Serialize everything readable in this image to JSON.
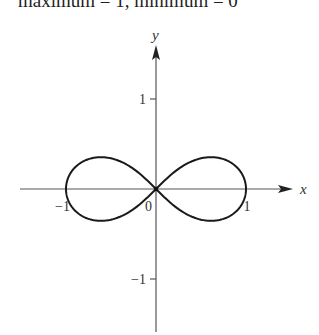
{
  "caption": "maximum = 1, minimum = 0",
  "chart_data": {
    "type": "line",
    "title": "",
    "curve": "lemniscate r^2 = cos(2θ)",
    "xlabel": "x",
    "ylabel": "y",
    "xlim": [
      -1.5,
      1.5
    ],
    "ylim": [
      -1.5,
      1.5
    ],
    "x_ticks": [
      {
        "value": -1,
        "label": "−1"
      },
      {
        "value": 0,
        "label": "0"
      },
      {
        "value": 1,
        "label": "1"
      }
    ],
    "y_ticks": [
      {
        "value": 1,
        "label": "1"
      },
      {
        "value": -1,
        "label": "−1"
      }
    ],
    "grid": false,
    "series": [
      {
        "name": "lemniscate",
        "samples": 200
      }
    ]
  }
}
